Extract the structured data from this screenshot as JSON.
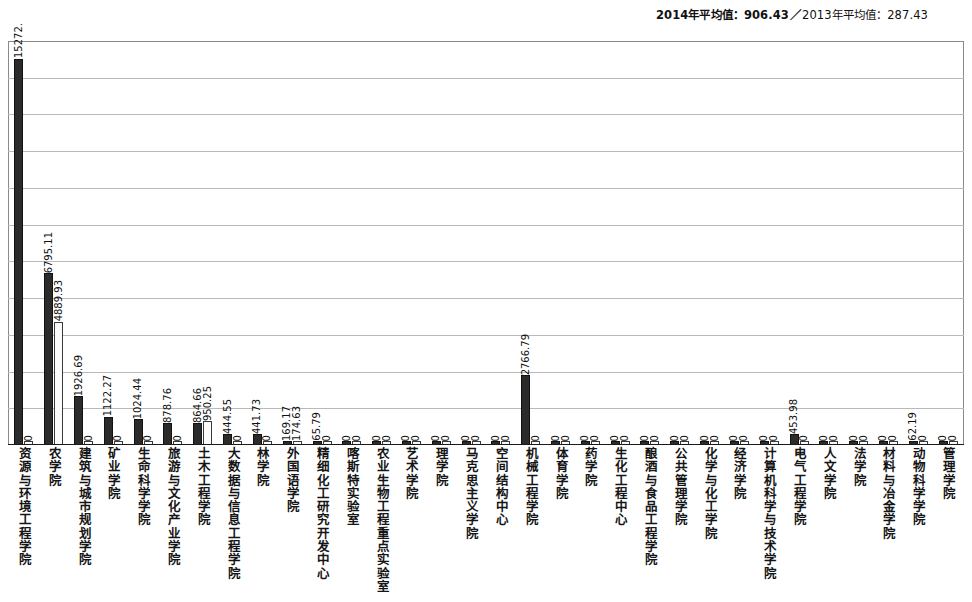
{
  "header": {
    "avg_2014_label": "2014年平均值：906.43",
    "separator": "／",
    "avg_2013_label": "2013年平均值：287.43"
  },
  "colors": {
    "series_2014": "#2b2b2b",
    "series_2013": "#fbfbfb",
    "gridline": "#b9b9b9",
    "frame": "#8a8a8a",
    "axis": "#1a1a1a"
  },
  "chart_data": {
    "type": "bar",
    "title": "",
    "subtitle": "",
    "xlabel": "",
    "ylabel": "",
    "grid": true,
    "legend_position": "none",
    "ylim": [
      0,
      16000
    ],
    "gridline_count": 10,
    "categories": [
      "资源与环境工程学院",
      "农学院",
      "建筑与城市规划学院",
      "矿业学院",
      "生命科学学院",
      "旅游与文化产业学院",
      "土木工程学院",
      "大数据与信息工程学院",
      "林学院",
      "外国语学院",
      "精细化工研究开发中心",
      "喀斯特实验室",
      "农业生物工程重点实验室",
      "艺术学院",
      "理学院",
      "马克思主义学院",
      "空间结构中心",
      "机械工程学院",
      "体育学院",
      "药学院",
      "生化工程中心",
      "酿酒与食品工程学院",
      "公共管理学院",
      "化学与化工学院",
      "经济学院",
      "计算机科学与技术学院",
      "电气工程学院",
      "人文学院",
      "法学院",
      "材料与冶金学院",
      "动物科学学院",
      "管理学院"
    ],
    "series": [
      {
        "name": "2014年",
        "values": [
          15272.0,
          6795.11,
          1926.69,
          1122.27,
          1024.44,
          878.76,
          864.66,
          444.55,
          441.73,
          169.17,
          65.79,
          0,
          0,
          0,
          0,
          0,
          0,
          2766.79,
          0,
          0,
          0,
          0,
          0,
          0,
          0,
          0,
          453.98,
          0,
          0,
          0,
          62.19,
          0
        ],
        "labels": [
          "15272.",
          "6795.11",
          "1926.69",
          "1122.27",
          "1024.44",
          "878.76",
          "864.66",
          "444.55",
          "441.73",
          "169.17",
          "65.79",
          "0",
          "0",
          "0",
          "0",
          "0",
          "0",
          "2766.79",
          "0",
          "0",
          "0",
          "0",
          "0",
          "0",
          "0",
          "0",
          "453.98",
          "0",
          "0",
          "0",
          "62.19",
          "0"
        ]
      },
      {
        "name": "2013年",
        "values": [
          0,
          4889.93,
          0,
          0,
          0,
          0,
          950.25,
          0,
          0,
          174.63,
          0,
          0,
          0,
          0,
          0,
          0,
          0,
          0,
          0,
          0,
          0,
          0,
          0,
          0,
          0,
          0,
          0,
          0,
          0,
          0,
          0,
          0
        ],
        "labels": [
          "0",
          "4889.93",
          "0",
          "0",
          "0",
          "0",
          "950.25",
          "0",
          "0",
          "174.63",
          "0",
          "0",
          "0",
          "0",
          "0",
          "0",
          "0",
          "0",
          "0",
          "0",
          "0",
          "0",
          "0",
          "0",
          "0",
          "0",
          "0",
          "0",
          "0",
          "0",
          "0",
          "0"
        ]
      }
    ]
  }
}
